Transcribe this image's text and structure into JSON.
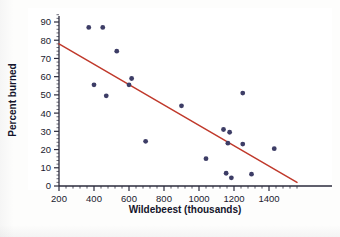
{
  "figure": {
    "background_color": "#fdfdfc",
    "plot_background_color": "#ffffff"
  },
  "axes": {
    "x_title": "Wildebeest (thousands)",
    "y_title": "Percent burned",
    "x_tick_labels": [
      "200",
      "400",
      "600",
      "800",
      "1000",
      "1200",
      "1400"
    ],
    "y_tick_labels": [
      "0",
      "10",
      "20",
      "30",
      "40",
      "50",
      "60",
      "70",
      "80",
      "90"
    ],
    "axis_color": "#2b2b3d"
  },
  "colors": {
    "point_color": "#3d3d66",
    "trend_line_color": "#c0392b",
    "axis_color": "#2b2b3d",
    "text_color": "#14142b"
  },
  "chart_data": {
    "type": "scatter",
    "title": "",
    "xlabel": "Wildebeest (thousands)",
    "ylabel": "Percent burned",
    "xlim": [
      150,
      1560
    ],
    "ylim": [
      0,
      95
    ],
    "xticks": [
      200,
      400,
      600,
      800,
      1000,
      1200,
      1400
    ],
    "yticks": [
      0,
      10,
      20,
      30,
      40,
      50,
      60,
      70,
      80,
      90
    ],
    "minor_ticks": true,
    "grid": false,
    "legend": null,
    "points": [
      {
        "x": 370,
        "y": 87
      },
      {
        "x": 450,
        "y": 87
      },
      {
        "x": 400,
        "y": 55.5
      },
      {
        "x": 470,
        "y": 49.5
      },
      {
        "x": 530,
        "y": 74
      },
      {
        "x": 600,
        "y": 55.5
      },
      {
        "x": 615,
        "y": 59
      },
      {
        "x": 695,
        "y": 24.5
      },
      {
        "x": 900,
        "y": 44
      },
      {
        "x": 1040,
        "y": 15
      },
      {
        "x": 1140,
        "y": 31
      },
      {
        "x": 1175,
        "y": 29.5
      },
      {
        "x": 1165,
        "y": 23.5
      },
      {
        "x": 1155,
        "y": 7
      },
      {
        "x": 1185,
        "y": 4.5
      },
      {
        "x": 1250,
        "y": 51
      },
      {
        "x": 1250,
        "y": 23
      },
      {
        "x": 1300,
        "y": 6.5
      },
      {
        "x": 1430,
        "y": 20.5
      }
    ],
    "trend_line": {
      "type": "linear-fit",
      "x_start": 200,
      "y_start": 78,
      "x_end": 1560,
      "y_end": 2,
      "slope_per_unit_x": -0.0559,
      "intercept": 89.2
    }
  }
}
